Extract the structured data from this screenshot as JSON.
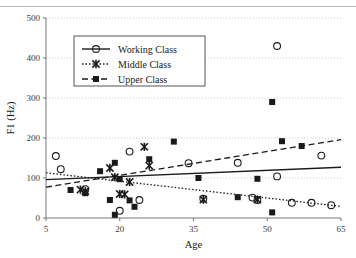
{
  "chart_data": {
    "type": "scatter",
    "title": "",
    "xlabel": "Age",
    "ylabel": "F1 (Hz)",
    "xlim": [
      5,
      65
    ],
    "ylim": [
      0,
      500
    ],
    "xticks": [
      5,
      20,
      35,
      50,
      65
    ],
    "yticks": [
      0,
      100,
      200,
      300,
      400,
      500
    ],
    "grid": true,
    "grid_style": "dotted-horizontal",
    "legend_position": "top-left-inside",
    "series": [
      {
        "name": "Working Class",
        "marker": "open-circle",
        "line_style": "solid",
        "color": "#1a1a1a",
        "points": [
          {
            "x": 7,
            "y": 155
          },
          {
            "x": 8,
            "y": 122
          },
          {
            "x": 13,
            "y": 72
          },
          {
            "x": 20,
            "y": 18
          },
          {
            "x": 22,
            "y": 166
          },
          {
            "x": 24,
            "y": 45
          },
          {
            "x": 34,
            "y": 137
          },
          {
            "x": 37,
            "y": 48
          },
          {
            "x": 44,
            "y": 138
          },
          {
            "x": 47,
            "y": 51
          },
          {
            "x": 48,
            "y": 45
          },
          {
            "x": 52,
            "y": 430
          },
          {
            "x": 52,
            "y": 104
          },
          {
            "x": 55,
            "y": 38
          },
          {
            "x": 59,
            "y": 38
          },
          {
            "x": 61,
            "y": 156
          },
          {
            "x": 63,
            "y": 32
          }
        ],
        "fit_line": {
          "x0": 5,
          "y0": 96,
          "x1": 65,
          "y1": 127
        }
      },
      {
        "name": "Middle Class",
        "marker": "asterisk",
        "line_style": "dotted",
        "color": "#1a1a1a",
        "points": [
          {
            "x": 12,
            "y": 71
          },
          {
            "x": 13,
            "y": 67
          },
          {
            "x": 18,
            "y": 125
          },
          {
            "x": 19,
            "y": 102
          },
          {
            "x": 20,
            "y": 60
          },
          {
            "x": 21,
            "y": 59
          },
          {
            "x": 22,
            "y": 90
          },
          {
            "x": 25,
            "y": 178
          },
          {
            "x": 26,
            "y": 131
          },
          {
            "x": 37,
            "y": 46
          },
          {
            "x": 48,
            "y": 46
          }
        ],
        "fit_line": {
          "x0": 5,
          "y0": 113,
          "x1": 65,
          "y1": 29
        }
      },
      {
        "name": "Upper Class",
        "marker": "filled-square",
        "line_style": "dashed",
        "color": "#1a1a1a",
        "points": [
          {
            "x": 10,
            "y": 70
          },
          {
            "x": 13,
            "y": 62
          },
          {
            "x": 16,
            "y": 117
          },
          {
            "x": 18,
            "y": 45
          },
          {
            "x": 19,
            "y": 8
          },
          {
            "x": 19,
            "y": 138
          },
          {
            "x": 20,
            "y": 97
          },
          {
            "x": 22,
            "y": 44
          },
          {
            "x": 23,
            "y": 28
          },
          {
            "x": 26,
            "y": 147
          },
          {
            "x": 31,
            "y": 191
          },
          {
            "x": 36,
            "y": 100
          },
          {
            "x": 44,
            "y": 52
          },
          {
            "x": 48,
            "y": 98
          },
          {
            "x": 51,
            "y": 290
          },
          {
            "x": 51,
            "y": 14
          },
          {
            "x": 53,
            "y": 192
          },
          {
            "x": 57,
            "y": 180
          }
        ],
        "fit_line": {
          "x0": 5,
          "y0": 77,
          "x1": 65,
          "y1": 196
        }
      }
    ]
  },
  "legend": {
    "items": [
      {
        "label": "Working Class"
      },
      {
        "label": "Middle Class"
      },
      {
        "label": "Upper Class"
      }
    ]
  },
  "axis": {
    "x_title": "Age",
    "y_title": "F1 (Hz)",
    "x_tick_labels": [
      "5",
      "20",
      "35",
      "50",
      "65"
    ],
    "y_tick_labels": [
      "0",
      "100",
      "200",
      "300",
      "400",
      "500"
    ]
  }
}
